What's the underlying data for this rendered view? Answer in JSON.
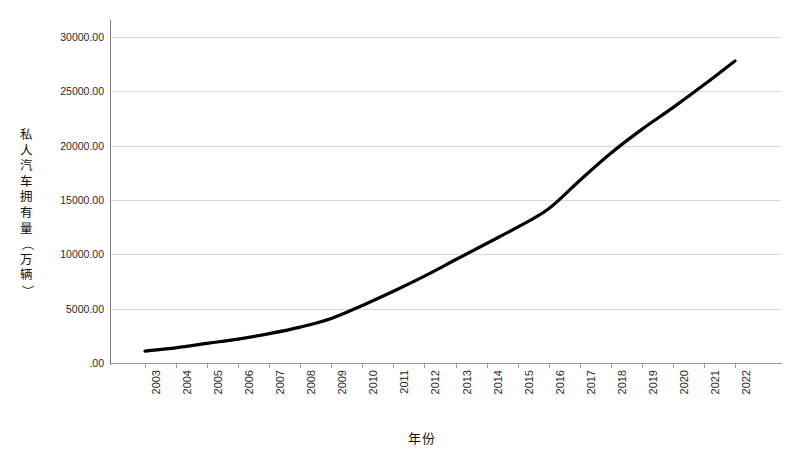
{
  "chart_data": {
    "type": "line",
    "title": "",
    "xlabel": "年份",
    "ylabel": "私人汽车拥有量（万辆）",
    "categories": [
      "2003",
      "2004",
      "2005",
      "2006",
      "2007",
      "2008",
      "2009",
      "2010",
      "2011",
      "2012",
      "2013",
      "2014",
      "2015",
      "2016",
      "2017",
      "2018",
      "2019",
      "2020",
      "2021",
      "2022"
    ],
    "x": [
      2003,
      2004,
      2005,
      2006,
      2007,
      2008,
      2009,
      2010,
      2011,
      2012,
      2013,
      2014,
      2015,
      2016,
      2017,
      2018,
      2019,
      2020,
      2021,
      2022
    ],
    "series": [
      {
        "name": "私人汽车拥有量",
        "values": [
          1100,
          1400,
          1800,
          2200,
          2700,
          3300,
          4100,
          5300,
          6600,
          8000,
          9500,
          11000,
          12500,
          14200,
          16800,
          19300,
          21500,
          23500,
          25600,
          27800
        ]
      }
    ],
    "ylim": [
      0,
      30000
    ],
    "ytick_values": [
      0,
      5000,
      10000,
      15000,
      20000,
      25000,
      30000
    ],
    "ytick_labels": [
      ".00",
      "5000.00",
      "10000.00",
      "15000.00",
      "20000.00",
      "25000.00",
      "30000.00"
    ],
    "grid": true,
    "legend": false,
    "legend_position": "none",
    "line_color": "#000000",
    "grid_color": "#d9d9d9",
    "axis_color": "#7f7f7f"
  },
  "axis_titles": {
    "y_chars": [
      "私",
      "人",
      "汽",
      "车",
      "拥",
      "有",
      "量",
      "（",
      "万",
      "辆",
      "）"
    ],
    "x": "年份"
  }
}
